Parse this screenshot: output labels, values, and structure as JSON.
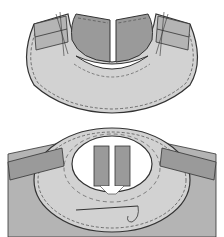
{
  "figures": [
    {
      "id": "step-1",
      "description": "Neckline facing pinned to bodice shoulder seams, viewed from inside"
    },
    {
      "id": "step-2",
      "description": "Facing hand-stitched around neckline opening with needle and thread"
    }
  ],
  "colors": {
    "background": "#ffffff",
    "fabric_light": "#d2d2d2",
    "fabric_mid": "#b4b4b4",
    "fabric_dark": "#9a9a9a",
    "outline": "#333333",
    "stitch": "#444444"
  }
}
